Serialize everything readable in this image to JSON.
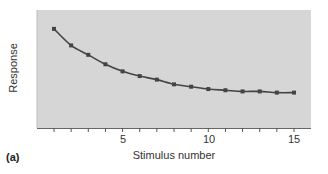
{
  "chart_data": {
    "type": "line",
    "title": "",
    "panel_label": "(a)",
    "xlabel": "Stimulus number",
    "ylabel": "Response",
    "x": [
      1,
      2,
      3,
      4,
      5,
      6,
      7,
      8,
      9,
      10,
      11,
      12,
      13,
      14,
      15
    ],
    "values": [
      84,
      70,
      62,
      54,
      48,
      44,
      41,
      37,
      35,
      33,
      32,
      31,
      31,
      30,
      30
    ],
    "series": [
      {
        "name": "Response",
        "values": [
          84,
          70,
          62,
          54,
          48,
          44,
          41,
          37,
          35,
          33,
          32,
          31,
          31,
          30,
          30
        ]
      }
    ],
    "xlim": [
      0,
      16
    ],
    "ylim": [
      0,
      100
    ],
    "x_tick_labels": [
      "5",
      "10",
      "15"
    ],
    "x_tick_values": [
      5,
      10,
      15
    ],
    "x_minor_ticks": [
      1,
      2,
      3,
      4,
      5,
      6,
      7,
      8,
      9,
      10,
      11,
      12,
      13,
      14,
      15
    ],
    "y_tick_labels": [],
    "grid": false,
    "legend": null,
    "colors": {
      "background": "#d6d6d6",
      "line": "#444444",
      "marker": "#444444",
      "axis": "#555555"
    }
  },
  "labels": {
    "xlabel": "Stimulus number",
    "ylabel": "Response",
    "panel": "(a)",
    "tick_5": "5",
    "tick_10": "10",
    "tick_15": "15"
  }
}
